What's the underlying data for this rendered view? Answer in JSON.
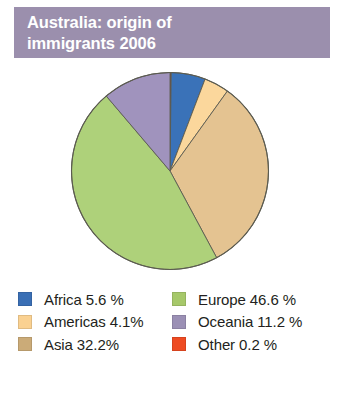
{
  "header": {
    "title": "Australia: origin of\nimmigrants 2006",
    "background_color": "#9b8fad",
    "text_color": "#ffffff"
  },
  "legend": {
    "columns": [
      {
        "items": [
          {
            "label": "Africa 5.6 %",
            "color": "#3a6fb5",
            "name": "Africa",
            "value": 5.6
          },
          {
            "label": "Americas 4.1%",
            "color": "#fad191",
            "name": "Americas",
            "value": 4.1
          },
          {
            "label": "Asia 32.2%",
            "color": "#cbab78",
            "name": "Asia",
            "value": 32.2
          }
        ]
      },
      {
        "items": [
          {
            "label": "Europe 46.6 %",
            "color": "#a6c86a",
            "name": "Europe",
            "value": 46.6
          },
          {
            "label": "Oceania 11.2 %",
            "color": "#9b90b5",
            "name": "Oceania",
            "value": 11.2
          },
          {
            "label": "Other 0.2 %",
            "color": "#ee4b22",
            "name": "Other",
            "value": 0.2
          }
        ]
      }
    ]
  },
  "chart_data": {
    "type": "pie",
    "title": "Australia: origin of immigrants 2006",
    "xlabel": "",
    "ylabel": "",
    "units": "percent",
    "start_angle_deg": 0,
    "direction": "clockwise",
    "legend_position": "bottom",
    "grid": false,
    "categories": [
      "Other",
      "Africa",
      "Americas",
      "Asia",
      "Europe",
      "Oceania"
    ],
    "values": [
      0.2,
      5.6,
      4.1,
      32.2,
      46.6,
      11.2
    ],
    "slice_colors": [
      "#a23527",
      "#3a72b8",
      "#fbd79c",
      "#e4c391",
      "#aed17a",
      "#a093bd"
    ],
    "slice_order_from_12_oclock_clockwise": [
      {
        "name": "Other",
        "value": 0.2,
        "color": "#a23527"
      },
      {
        "name": "Africa",
        "value": 5.6,
        "color": "#3a72b8"
      },
      {
        "name": "Americas",
        "value": 4.1,
        "color": "#fbd79c"
      },
      {
        "name": "Asia",
        "value": 32.2,
        "color": "#e4c391"
      },
      {
        "name": "Europe",
        "value": 46.6,
        "color": "#aed17a"
      },
      {
        "name": "Oceania",
        "value": 11.2,
        "color": "#a093bd"
      }
    ],
    "total": 99.9
  }
}
